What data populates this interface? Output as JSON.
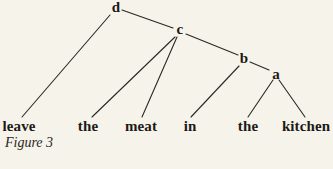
{
  "figure": {
    "caption": "Figure 3",
    "type": "syntax tree"
  },
  "tree": {
    "nodes": [
      {
        "id": "d",
        "label": "d"
      },
      {
        "id": "c",
        "label": "c"
      },
      {
        "id": "b",
        "label": "b"
      },
      {
        "id": "a",
        "label": "a"
      }
    ],
    "leaves": [
      {
        "label": "leave"
      },
      {
        "label": "the"
      },
      {
        "label": "meat"
      },
      {
        "label": "in"
      },
      {
        "label": "the"
      },
      {
        "label": "kitchen"
      }
    ],
    "edges": [
      [
        "d",
        "leave"
      ],
      [
        "d",
        "c"
      ],
      [
        "c",
        "the"
      ],
      [
        "c",
        "meat"
      ],
      [
        "c",
        "b"
      ],
      [
        "b",
        "in"
      ],
      [
        "b",
        "a"
      ],
      [
        "a",
        "the"
      ],
      [
        "a",
        "kitchen"
      ]
    ]
  }
}
